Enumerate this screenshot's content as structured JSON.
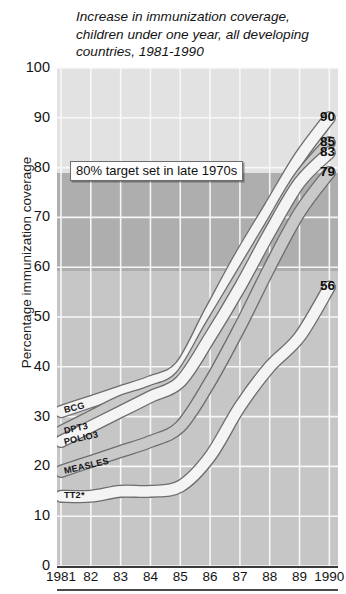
{
  "title": {
    "line1": "Increase in immunization coverage,",
    "line2": "children under one year, all developing",
    "line3": "countries, 1981-1990"
  },
  "axes": {
    "ylabel": "Percentage immunization coverage",
    "yticks": [
      "0",
      "10",
      "20",
      "30",
      "40",
      "50",
      "60",
      "70",
      "80",
      "90",
      "100"
    ],
    "xticks": [
      "1981",
      "82",
      "83",
      "84",
      "85",
      "86",
      "87",
      "88",
      "89",
      "1990"
    ]
  },
  "annotation": {
    "target_note": "80% target set in late 1970s"
  },
  "series_labels": {
    "bcg": "BCG",
    "dpt3": "DPT3",
    "polio3": "POLIO3",
    "measles": "MEASLES",
    "tt2": "TT2*"
  },
  "end_labels": {
    "bcg": "90",
    "dpt3": "85",
    "polio3": "83",
    "measles": "79",
    "tt2": "56"
  },
  "colors": {
    "band_above_80": "#e2e2e2",
    "band_60_to_80": "#aeaeae",
    "band_below_60": "#c6c6c6",
    "gridline": "#fafafa",
    "ribbon_light": "#f4f4f4",
    "ribbon_mid": "#c9c9c9",
    "ribbon_outline": "#6d6d6d",
    "text": "#141414"
  },
  "chart_data": {
    "type": "line",
    "title": "Increase in immunization coverage, children under one year, all developing countries, 1981-1990",
    "xlabel": "",
    "ylabel": "Percentage immunization coverage",
    "x": [
      1981,
      1982,
      1983,
      1984,
      1985,
      1986,
      1987,
      1988,
      1989,
      1990
    ],
    "xtick_labels": [
      "1981",
      "82",
      "83",
      "84",
      "85",
      "86",
      "87",
      "88",
      "89",
      "1990"
    ],
    "ylim": [
      0,
      100
    ],
    "ytick_step": 10,
    "grid": true,
    "legend": "inline-left-labels",
    "annotations": [
      {
        "text": "80% target set in late 1970s",
        "y": 80,
        "type": "threshold-note"
      }
    ],
    "shaded_bands": [
      {
        "from": 80,
        "to": 100,
        "color": "#e2e2e2"
      },
      {
        "from": 60,
        "to": 80,
        "color": "#aeaeae"
      },
      {
        "from": 0,
        "to": 60,
        "color": "#c6c6c6"
      }
    ],
    "series": [
      {
        "name": "BCG",
        "end_value": 90,
        "values": [
          31,
          33,
          35,
          37,
          40,
          51,
          62,
          72,
          82,
          90
        ]
      },
      {
        "name": "DPT3",
        "end_value": 85,
        "values": [
          27,
          30,
          33,
          35,
          38,
          48,
          58,
          68,
          78,
          85
        ]
      },
      {
        "name": "POLIO3",
        "end_value": 83,
        "values": [
          25,
          28,
          31,
          34,
          37,
          46,
          56,
          67,
          77,
          83
        ]
      },
      {
        "name": "MEASLES",
        "end_value": 79,
        "values": [
          19,
          21,
          23,
          25,
          28,
          37,
          48,
          60,
          71,
          79
        ]
      },
      {
        "name": "TT2*",
        "end_value": 56,
        "values": [
          14,
          14,
          15,
          15,
          16,
          22,
          32,
          40,
          46,
          56
        ]
      }
    ]
  }
}
